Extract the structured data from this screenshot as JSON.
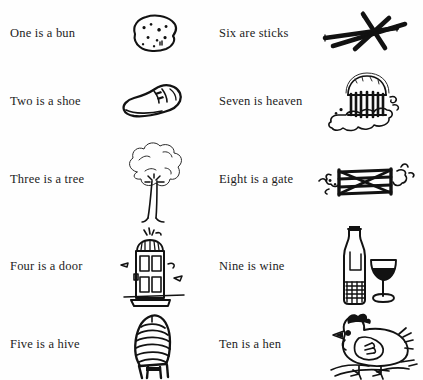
{
  "page": {
    "background_color": "#fefefe",
    "ink_color": "#121212"
  },
  "columns": [
    {
      "name": "left-column",
      "rows": [
        {
          "number": 1,
          "label": "One is a bun",
          "icon": "bun-icon"
        },
        {
          "number": 2,
          "label": "Two is a shoe",
          "icon": "shoe-icon"
        },
        {
          "number": 3,
          "label": "Three is a tree",
          "icon": "tree-icon"
        },
        {
          "number": 4,
          "label": "Four is a door",
          "icon": "door-icon"
        },
        {
          "number": 5,
          "label": "Five is a hive",
          "icon": "hive-icon"
        }
      ]
    },
    {
      "name": "right-column",
      "rows": [
        {
          "number": 6,
          "label": "Six are sticks",
          "icon": "sticks-icon"
        },
        {
          "number": 7,
          "label": "Seven is heaven",
          "icon": "heaven-icon"
        },
        {
          "number": 8,
          "label": "Eight is a gate",
          "icon": "gate-icon"
        },
        {
          "number": 9,
          "label": "Nine is wine",
          "icon": "wine-icon"
        },
        {
          "number": 10,
          "label": "Ten is a hen",
          "icon": "hen-icon"
        }
      ]
    }
  ]
}
